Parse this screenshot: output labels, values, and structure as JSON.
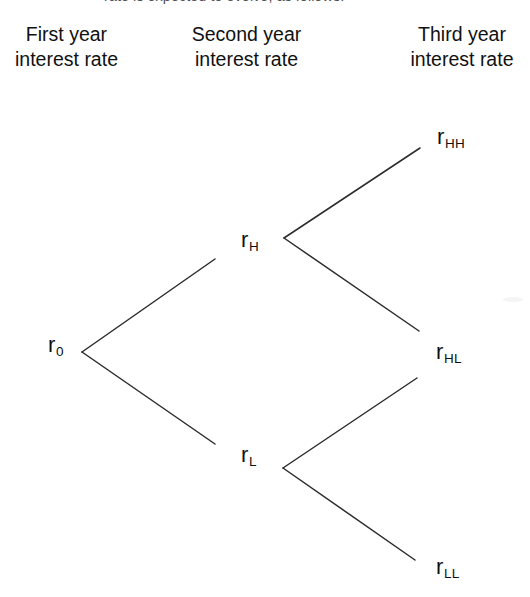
{
  "figure": {
    "background_color": "#ffffff",
    "line_color": "#2c2c2c",
    "text_color": "#111111",
    "clipped_caption": "rate is expected to evolve, as follows:"
  },
  "headers": [
    {
      "line1": "First year",
      "line2": "interest rate"
    },
    {
      "line1": "Second year",
      "line2": "interest rate"
    },
    {
      "line1": "Third year",
      "line2": "interest rate"
    }
  ],
  "chart_data": {
    "type": "diagram",
    "diagram_type": "binomial-tree",
    "columns": [
      "First year interest rate",
      "Second year interest rate",
      "Third year interest rate"
    ],
    "nodes": [
      {
        "id": "r0",
        "base": "r",
        "sub": "0",
        "label": "r0",
        "period": 1,
        "x": 58,
        "y": 345
      },
      {
        "id": "rH",
        "base": "r",
        "sub": "H",
        "label": "rH",
        "period": 2,
        "x": 250,
        "y": 240
      },
      {
        "id": "rL",
        "base": "r",
        "sub": "L",
        "label": "rL",
        "period": 2,
        "x": 250,
        "y": 455
      },
      {
        "id": "rHH",
        "base": "r",
        "sub": "HH",
        "label": "rHH",
        "period": 3,
        "x": 452,
        "y": 137
      },
      {
        "id": "rHL",
        "base": "r",
        "sub": "HL",
        "label": "rHL",
        "period": 3,
        "x": 450,
        "y": 352
      },
      {
        "id": "rLL",
        "base": "r",
        "sub": "LL",
        "label": "rLL",
        "period": 3,
        "x": 450,
        "y": 567
      }
    ],
    "edges": [
      {
        "from": "r0",
        "to": "rH",
        "direction": "up",
        "x1": 82,
        "y1": 352,
        "x2": 215,
        "y2": 259
      },
      {
        "from": "r0",
        "to": "rL",
        "direction": "down",
        "x1": 82,
        "y1": 352,
        "x2": 215,
        "y2": 444
      },
      {
        "from": "rH",
        "to": "rHH",
        "direction": "up",
        "x1": 284,
        "y1": 238,
        "x2": 420,
        "y2": 148
      },
      {
        "from": "rH",
        "to": "rHL",
        "direction": "down",
        "x1": 284,
        "y1": 238,
        "x2": 419,
        "y2": 331
      },
      {
        "from": "rL",
        "to": "rHL",
        "direction": "up",
        "x1": 283,
        "y1": 468,
        "x2": 417,
        "y2": 378
      },
      {
        "from": "rL",
        "to": "rLL",
        "direction": "down",
        "x1": 283,
        "y1": 468,
        "x2": 415,
        "y2": 560
      }
    ]
  }
}
